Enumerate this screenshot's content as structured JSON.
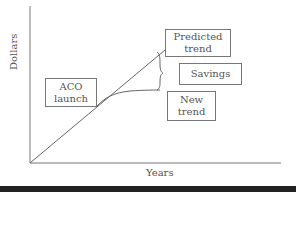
{
  "diagram": {
    "axes": {
      "y_label": "Dollars",
      "x_label": "Years"
    },
    "boxes": {
      "aco_launch": {
        "line1": "ACO",
        "line2": "launch"
      },
      "predicted_trend": {
        "line1": "Predicted",
        "line2": "trend"
      },
      "savings": {
        "label": "Savings"
      },
      "new_trend": {
        "line1": "New",
        "line2": "trend"
      }
    },
    "colors": {
      "line": "#666666",
      "bottom_bar": "#222222"
    }
  }
}
